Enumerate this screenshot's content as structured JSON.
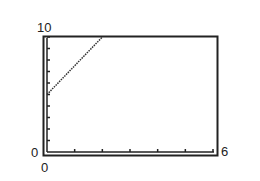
{
  "chart_data": {
    "type": "line",
    "title": "",
    "xlabel": "",
    "ylabel": "",
    "xlim": [
      0,
      6
    ],
    "ylim": [
      0,
      10
    ],
    "x_tick_count": 6,
    "y_tick_count": 10,
    "grid": false,
    "legend": null,
    "series": [
      {
        "name": "line",
        "style": "dotted",
        "color": "#333333",
        "x": [
          0,
          2
        ],
        "y": [
          5,
          10
        ]
      }
    ],
    "tick_labels": {
      "y_max": "10",
      "y_min": "0",
      "x_min": "0",
      "x_max": "6"
    }
  }
}
